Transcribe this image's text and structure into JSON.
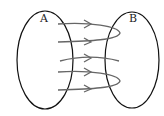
{
  "diagram": {
    "type": "mapping-diagram",
    "set_a": {
      "label": "A"
    },
    "set_b": {
      "label": "B"
    },
    "arrow_count": 5,
    "colors": {
      "ellipse": "#111111",
      "arrow": "#666666"
    }
  }
}
